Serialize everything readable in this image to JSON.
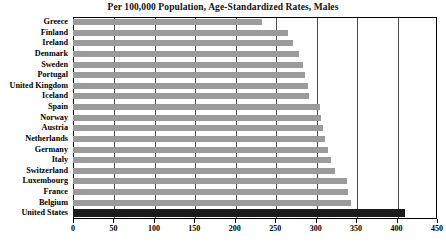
{
  "chart_data": {
    "type": "bar",
    "orientation": "horizontal",
    "title": "Per 100,000 Population, Age-Standardized Rates, Males",
    "xlabel": "",
    "ylabel": "",
    "xlim": [
      0,
      450
    ],
    "xticks": [
      0,
      50,
      100,
      150,
      200,
      250,
      300,
      350,
      400,
      450
    ],
    "grid": true,
    "legend": "none",
    "categories": [
      "Greece",
      "Finland",
      "Ireland",
      "Denmark",
      "Sweden",
      "Portugal",
      "United Kingdom",
      "Iceland",
      "Spain",
      "Norway",
      "Austria",
      "Netherlands",
      "Germany",
      "Italy",
      "Switzerland",
      "Luxembourg",
      "France",
      "Belgium",
      "United States"
    ],
    "values": [
      234,
      266,
      272,
      279,
      284,
      287,
      290,
      292,
      305,
      307,
      309,
      312,
      315,
      319,
      324,
      339,
      340,
      344,
      410
    ],
    "highlight_category": "United States",
    "colors": {
      "bar": "#9b9b9b",
      "highlight_bar": "#1b1b1b",
      "gridline": "#4d4d4d",
      "axis": "#000000",
      "background": "#ffffff",
      "text": "#000000"
    }
  }
}
